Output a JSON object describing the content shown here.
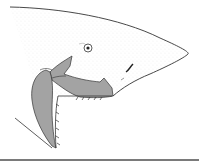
{
  "image": {
    "subject": "shark head illustration with protruded jaws",
    "colors": {
      "background": "#ffffff",
      "outline": "#333333",
      "jaw_fill": "#a3a3a3",
      "stipple": "#bdbdbd",
      "rule": "#7a7a7a"
    }
  }
}
